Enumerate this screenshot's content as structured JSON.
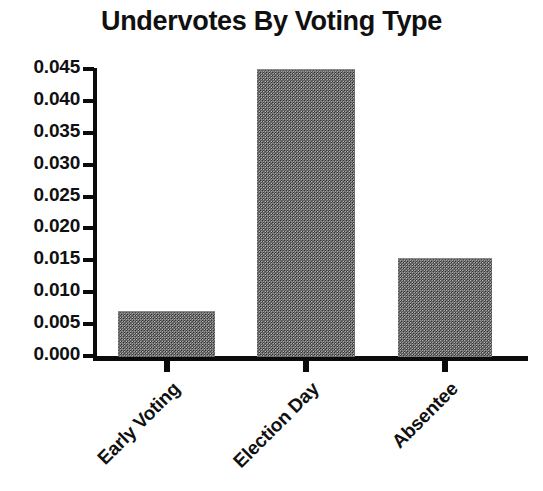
{
  "chart_data": {
    "type": "bar",
    "title": "Undervotes By Voting Type",
    "xlabel": "",
    "ylabel": "",
    "categories": [
      "Early Voting",
      "Election Day",
      "Absentee"
    ],
    "values": [
      0.007,
      0.045,
      0.0153
    ],
    "ylim": [
      0.0,
      0.045
    ],
    "yticks": [
      0.0,
      0.005,
      0.01,
      0.015,
      0.02,
      0.025,
      0.03,
      0.035,
      0.04,
      0.045
    ],
    "ytick_labels": [
      "0.000",
      "0.005",
      "0.010",
      "0.015",
      "0.020",
      "0.025",
      "0.030",
      "0.035",
      "0.040",
      "0.045"
    ],
    "grid": false,
    "legend": null,
    "bar_color": "#7d7d7d",
    "axis_color": "#0b0b0b",
    "text_color": "#101010",
    "background": "#ffffff"
  }
}
